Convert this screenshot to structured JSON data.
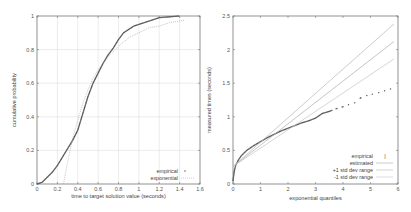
{
  "chart_data": [
    {
      "type": "line",
      "title": "",
      "xlabel": "time to target solution value (seconds)",
      "ylabel": "cumulative probability",
      "xlim": [
        0,
        1.6
      ],
      "ylim": [
        0,
        1
      ],
      "xticks": [
        "0",
        "0.2",
        "0.4",
        "0.6",
        "0.8",
        "1",
        "1.2",
        "1.4",
        "1.6"
      ],
      "yticks": [
        "0",
        "0.2",
        "0.4",
        "0.6",
        "0.8",
        "1"
      ],
      "grid": true,
      "legend_position": "bottom-right",
      "series": [
        {
          "name": "empirical",
          "style": "points",
          "x": [
            0.0,
            0.05,
            0.1,
            0.15,
            0.2,
            0.25,
            0.3,
            0.35,
            0.4,
            0.45,
            0.5,
            0.55,
            0.6,
            0.65,
            0.7,
            0.75,
            0.8,
            0.85,
            0.9,
            0.95,
            1.0,
            1.05,
            1.1,
            1.15,
            1.2,
            1.3,
            1.4
          ],
          "y": [
            0.0,
            0.01,
            0.04,
            0.07,
            0.11,
            0.16,
            0.21,
            0.26,
            0.32,
            0.42,
            0.52,
            0.6,
            0.66,
            0.72,
            0.77,
            0.81,
            0.86,
            0.9,
            0.92,
            0.94,
            0.95,
            0.96,
            0.97,
            0.98,
            0.99,
            0.995,
            1.0
          ]
        },
        {
          "name": "exponential",
          "style": "dotted-line",
          "x": [
            0.26,
            0.3,
            0.35,
            0.4,
            0.45,
            0.5,
            0.55,
            0.6,
            0.7,
            0.8,
            0.9,
            1.0,
            1.1,
            1.2,
            1.3,
            1.4,
            1.45
          ],
          "y": [
            0.0,
            0.13,
            0.27,
            0.38,
            0.48,
            0.56,
            0.63,
            0.68,
            0.76,
            0.82,
            0.87,
            0.9,
            0.93,
            0.94,
            0.96,
            0.97,
            0.975
          ]
        }
      ]
    },
    {
      "type": "scatter",
      "title": "",
      "xlabel": "exponential quantiles",
      "ylabel": "measured times (seconds)",
      "xlim": [
        0,
        6
      ],
      "ylim": [
        0,
        2.5
      ],
      "xticks": [
        "0",
        "1",
        "2",
        "3",
        "4",
        "5",
        "6"
      ],
      "yticks": [
        "0",
        "0.5",
        "1",
        "1.5",
        "2",
        "2.5"
      ],
      "grid": false,
      "legend_position": "bottom-right",
      "series": [
        {
          "name": "empirical",
          "style": "points",
          "x": [
            0.0,
            0.05,
            0.1,
            0.2,
            0.3,
            0.4,
            0.5,
            0.75,
            1.0,
            1.25,
            1.5,
            1.75,
            2.0,
            2.25,
            2.5,
            2.75,
            3.0,
            3.25,
            3.5,
            3.75,
            4.0,
            4.2,
            4.4,
            4.7,
            5.0,
            5.3,
            5.85
          ],
          "y": [
            0.05,
            0.2,
            0.28,
            0.36,
            0.42,
            0.46,
            0.5,
            0.57,
            0.63,
            0.69,
            0.74,
            0.79,
            0.83,
            0.87,
            0.91,
            0.94,
            0.98,
            1.05,
            1.08,
            1.12,
            1.15,
            1.18,
            1.2,
            1.3,
            1.33,
            1.36,
            1.43
          ]
        },
        {
          "name": "estimated",
          "style": "line",
          "x": [
            0,
            5.85
          ],
          "y": [
            0.26,
            2.12
          ]
        },
        {
          "name": "+1 std dev range",
          "style": "line",
          "x": [
            0,
            5.85
          ],
          "y": [
            0.26,
            2.38
          ]
        },
        {
          "name": "-1 std dev range",
          "style": "line",
          "x": [
            0,
            5.85
          ],
          "y": [
            0.26,
            1.86
          ]
        }
      ]
    }
  ],
  "left_chart": {
    "xlabel": "time to target solution value (seconds)",
    "ylabel": "cumulative probability",
    "legend": [
      "empirical",
      "exponential"
    ]
  },
  "right_chart": {
    "xlabel": "exponential quantiles",
    "ylabel": "measured times (seconds)",
    "legend": [
      "empirical",
      "estimated",
      "+1 std dev range",
      "-1 std dev range"
    ]
  }
}
